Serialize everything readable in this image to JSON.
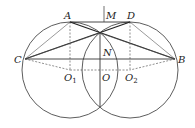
{
  "diagram": {
    "type": "geometry",
    "labels": {
      "A": "A",
      "M": "M",
      "D": "D",
      "C": "C",
      "B": "B",
      "N": "N",
      "O": "O",
      "O1_main": "O",
      "O1_sub": "1",
      "O2_main": "O",
      "O2_sub": "2"
    },
    "colors": {
      "stroke": "#333333",
      "background": "#ffffff"
    }
  }
}
